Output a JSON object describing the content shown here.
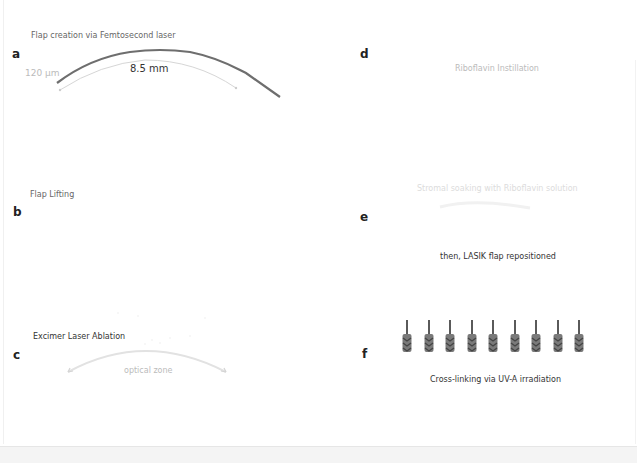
{
  "panels": {
    "a": {
      "letter": "a",
      "title": "Flap creation via Femtosecond laser",
      "thickness_label": "120 µm",
      "diameter_label": "8.5 mm"
    },
    "b": {
      "letter": "b",
      "title": "Flap Lifting"
    },
    "c": {
      "letter": "c",
      "title": "Excimer Laser Ablation",
      "zone_label": "optical zone"
    },
    "d": {
      "letter": "d",
      "title": "Riboflavin Instillation"
    },
    "e": {
      "letter": "e",
      "title": "Stromal soaking with Riboflavin solution",
      "subtitle": "then, LASIK flap repositioned"
    },
    "f": {
      "letter": "f",
      "title": "Cross-linking via UV-A irradiation",
      "uv_arrow_count": 9,
      "uv_arrow_icon": "uv-arrow-down-icon"
    }
  },
  "colors": {
    "flap_line": "#6e6e6e",
    "guide_line": "#d6d6d6",
    "uv_arrow": "#5a5a5a",
    "text_dark": "#222222",
    "text_muted": "#666666"
  }
}
